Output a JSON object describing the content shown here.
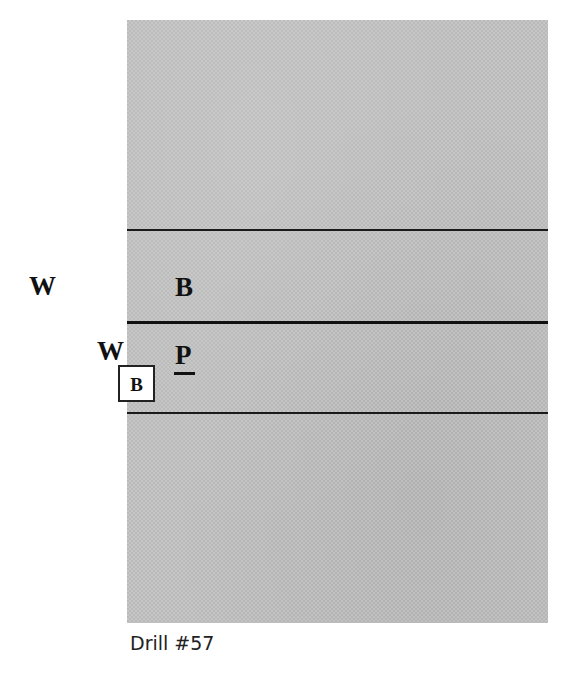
{
  "diagram": {
    "caption": "Drill #57",
    "field": {
      "fill_color": "#b9b9b9",
      "line_color": "#1a1a1a",
      "lines": [
        {
          "id": "line-top",
          "style": "thin"
        },
        {
          "id": "line-mid",
          "style": "thick"
        },
        {
          "id": "line-bot",
          "style": "thin"
        }
      ]
    },
    "players": [
      {
        "id": "w1",
        "label": "W",
        "zone": "outside-left",
        "row": "upper"
      },
      {
        "id": "b1",
        "label": "B",
        "zone": "inside",
        "row": "upper"
      },
      {
        "id": "w2",
        "label": "W",
        "zone": "edge-left",
        "row": "lower"
      },
      {
        "id": "p1",
        "label": "P",
        "zone": "inside",
        "row": "lower",
        "underlined": true
      }
    ],
    "ball_marker": {
      "label": "B",
      "boxed": true
    }
  }
}
